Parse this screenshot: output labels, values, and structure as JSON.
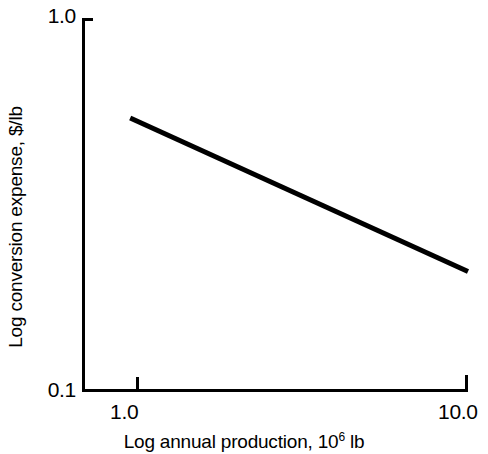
{
  "chart_data": {
    "type": "line",
    "title": "",
    "subtitle": "",
    "xlabel_text": "Log annual production, 10",
    "xlabel_sup": "6",
    "xlabel_tail": " lb",
    "xlabel_full": "Log annual production, 10^6 lb",
    "ylabel": "Log conversion expense, $/lb",
    "xscale": "log",
    "yscale": "log",
    "xlim": [
      0.72,
      10.0
    ],
    "ylim": [
      0.1,
      1.0
    ],
    "xticks": [
      "1.0",
      "10.0"
    ],
    "xtick_values": [
      1.0,
      10.0
    ],
    "yticks": [
      "0.1",
      "1.0"
    ],
    "ytick_values": [
      0.1,
      1.0
    ],
    "grid": false,
    "legend": false,
    "legend_position": "none",
    "annotations": [],
    "series": [
      {
        "name": "conversion expense",
        "color": "#000000",
        "linewidth": 5,
        "x": [
          1.0,
          10.0
        ],
        "y": [
          0.54,
          0.21
        ],
        "slope_log_log": -0.41
      }
    ]
  },
  "axes": {
    "y_tick_top_label": "1.0",
    "y_tick_bottom_label": "0.1",
    "x_tick_left_label": "1.0",
    "x_tick_right_label": "10.0",
    "y_axis_title": "Log conversion expense, $/lb",
    "x_axis_title_lead": "Log annual production, 10",
    "x_axis_title_exponent": "6",
    "x_axis_title_trail": " lb"
  },
  "style": {
    "background": "#ffffff",
    "ink": "#000000"
  }
}
